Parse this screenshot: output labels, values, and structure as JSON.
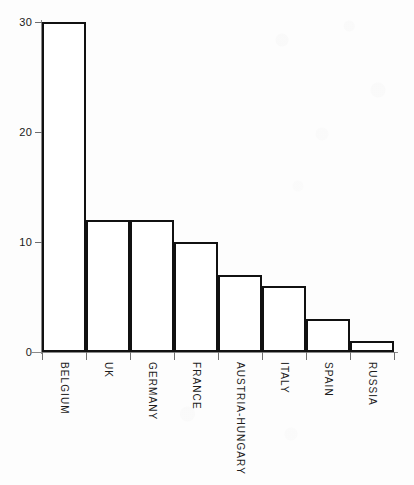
{
  "chart_data": {
    "type": "bar",
    "title": "",
    "subtitle": "",
    "xlabel": "",
    "ylabel": "",
    "categories": [
      "BELGIUM",
      "UK",
      "GERMANY",
      "FRANCE",
      "AUSTRIA-HUNGARY",
      "ITALY",
      "SPAIN",
      "RUSSIA"
    ],
    "values": [
      30,
      12,
      12,
      10,
      7,
      6,
      3,
      1
    ],
    "ylim": [
      0,
      30
    ],
    "yticks": [
      0,
      10,
      20,
      30
    ],
    "ytick_labels": [
      "0",
      "10",
      "20",
      "30"
    ],
    "grid": false,
    "legend": null,
    "annotations": [],
    "orientation": "vertical",
    "bar_style": {
      "fill": "#ffffff",
      "outline": "#111111",
      "outline_width_px": 2
    },
    "axis_style": {
      "line_color": "#8a8a8a",
      "tick_color": "#6e6e6e",
      "label_color": "#1a1a1a"
    },
    "category_label_rotation_deg": 90,
    "background": "#fdfdfd"
  }
}
